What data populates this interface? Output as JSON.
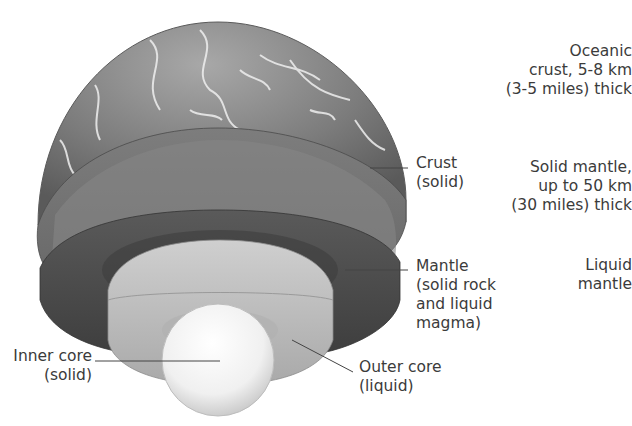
{
  "figure": {
    "layers": [
      {
        "id": "crust",
        "lines": [
          "Crust",
          "(solid)"
        ]
      },
      {
        "id": "mantle",
        "lines": [
          "Mantle",
          "(solid rock",
          "and liquid",
          "magma)"
        ]
      },
      {
        "id": "outer-core",
        "lines": [
          "Outer core",
          "(liquid)"
        ]
      },
      {
        "id": "inner-core",
        "lines": [
          "Inner core",
          "(solid)"
        ]
      }
    ],
    "side_notes": [
      {
        "id": "oceanic-crust",
        "lines": [
          "Oceanic",
          "crust, 5-8 km",
          "(3-5 miles) thick"
        ]
      },
      {
        "id": "solid-mantle",
        "lines": [
          "Solid mantle,",
          "up to 50 km",
          "(30 miles) thick"
        ]
      },
      {
        "id": "liquid-mantle",
        "lines": [
          "Liquid",
          "mantle"
        ]
      }
    ],
    "colors": {
      "background": "#ffffff",
      "crust_surface": "#8a8a8a",
      "clouds": "#f2f2f2",
      "crust_cut": "#767676",
      "mantle_cut": "#4e4e4e",
      "outer_core": "#bdbdbd",
      "inner_core": "#f4f4f4",
      "text": "#3b3b3b"
    }
  }
}
